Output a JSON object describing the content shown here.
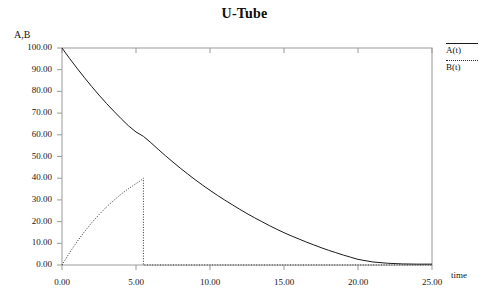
{
  "chart_data": {
    "type": "line",
    "title": "U-Tube",
    "xlabel": "time",
    "ylabel": "A,B",
    "xlim": [
      0,
      25
    ],
    "ylim": [
      0,
      100
    ],
    "grid": false,
    "legend_position": "right-top",
    "xticks": [
      0,
      5,
      10,
      15,
      20,
      25
    ],
    "yticks": [
      0,
      10,
      20,
      30,
      40,
      50,
      60,
      70,
      80,
      90,
      100
    ],
    "xtick_labels": [
      "0.00",
      "5.00",
      "10.00",
      "15.00",
      "20.00",
      "25.00"
    ],
    "ytick_labels": [
      "0.00",
      "10.00",
      "20.00",
      "30.00",
      "40.00",
      "50.00",
      "60.00",
      "70.00",
      "80.00",
      "90.00",
      "100.00"
    ],
    "series": [
      {
        "name": "A(t)",
        "style": "solid",
        "color": "#1a1a1a",
        "x": [
          0.0,
          0.5,
          1.0,
          1.5,
          2.0,
          2.5,
          3.0,
          3.5,
          4.0,
          4.5,
          5.0,
          5.5,
          6.0,
          6.5,
          7.0,
          7.5,
          8.0,
          8.5,
          9.0,
          9.5,
          10.0,
          10.5,
          11.0,
          11.5,
          12.0,
          12.5,
          13.0,
          13.5,
          14.0,
          14.5,
          15.0,
          15.5,
          16.0,
          16.5,
          17.0,
          17.5,
          18.0,
          18.5,
          19.0,
          19.5,
          20.0,
          21.0,
          22.0,
          23.0,
          24.0,
          25.0
        ],
        "y": [
          100.0,
          95.3,
          90.8,
          86.5,
          82.3,
          78.3,
          74.5,
          70.9,
          67.4,
          64.1,
          61.3,
          59.3,
          56.4,
          53.3,
          50.3,
          47.4,
          44.6,
          41.9,
          39.3,
          36.8,
          34.4,
          32.1,
          29.9,
          27.8,
          25.7,
          23.7,
          21.8,
          20.0,
          18.2,
          16.5,
          14.9,
          13.4,
          12.0,
          10.6,
          9.3,
          8.0,
          6.8,
          5.7,
          4.6,
          3.6,
          2.6,
          1.4,
          0.8,
          0.5,
          0.4,
          0.4
        ]
      },
      {
        "name": "B(t)",
        "style": "dotted",
        "color": "#2b2b2b",
        "x": [
          0.0,
          0.25,
          0.5,
          0.75,
          1.0,
          1.5,
          2.0,
          2.5,
          3.0,
          3.5,
          4.0,
          4.5,
          5.0,
          5.3,
          5.5,
          5.5,
          6.0,
          7.0,
          9.0,
          12.0,
          15.0,
          18.0,
          21.0,
          25.0
        ],
        "y": [
          0.0,
          2.8,
          5.5,
          8.1,
          10.6,
          15.2,
          19.4,
          23.2,
          26.7,
          29.8,
          32.7,
          35.2,
          37.5,
          38.8,
          40.0,
          0.0,
          0.0,
          0.0,
          0.0,
          0.0,
          0.0,
          0.0,
          0.0,
          0.0
        ]
      }
    ],
    "annotations": {
      "B_peak_value": 40.0,
      "B_peak_time": 5.5,
      "A_start_value": 100.0
    }
  },
  "legend": {
    "entries": [
      {
        "label": "A(t)",
        "style": "solid"
      },
      {
        "label": "B(t)",
        "style": "dotted"
      }
    ]
  },
  "axes": {
    "plot_left_px": 62,
    "plot_right_px": 432,
    "plot_top_px": 48,
    "plot_bottom_px": 265,
    "frame_color": "#9a9a9a"
  }
}
